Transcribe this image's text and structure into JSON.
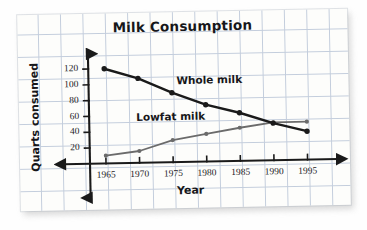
{
  "chart_data": {
    "type": "line",
    "title": "Milk Consumption",
    "xlabel": "Year",
    "ylabel": "Quarts consumed",
    "categories": [
      "1965",
      "1970",
      "1975",
      "1980",
      "1985",
      "1990",
      "1995"
    ],
    "x": [
      1965,
      1970,
      1975,
      1980,
      1985,
      1990,
      1995
    ],
    "xlim": [
      1965,
      1995
    ],
    "ylim": [
      0,
      130
    ],
    "yticks": [
      20,
      40,
      60,
      80,
      100,
      120
    ],
    "grid": true,
    "grid_style": "graph-paper",
    "legend": "inline-labels",
    "series": [
      {
        "name": "Whole milk",
        "color": "#1a1a1a",
        "values": [
          120,
          107,
          88,
          72,
          61,
          47,
          36
        ]
      },
      {
        "name": "Lowfat milk",
        "color": "#6b6b6b",
        "values": [
          10,
          15,
          28,
          35,
          42,
          48,
          48
        ]
      }
    ],
    "annotations": [
      {
        "text": "Whole milk",
        "x": 1976,
        "y": 103
      },
      {
        "text": "Lowfat milk",
        "x": 1972,
        "y": 57
      }
    ]
  },
  "ticks": {
    "y": [
      "120",
      "100",
      "80",
      "60",
      "40",
      "20"
    ],
    "x": [
      "1965",
      "1970",
      "1975",
      "1980",
      "1985",
      "1990",
      "1995"
    ]
  },
  "labels": {
    "title": "Milk Consumption",
    "x_axis": "Year",
    "y_axis": "Quarts consumed",
    "series_whole": "Whole milk",
    "series_lowfat": "Lowfat milk"
  },
  "colors": {
    "whole_milk": "#1a1a1a",
    "lowfat_milk": "#6b6b6b",
    "axis": "#1a1a1a",
    "grid": "#c3cddc",
    "paper": "#fdfdfb"
  }
}
